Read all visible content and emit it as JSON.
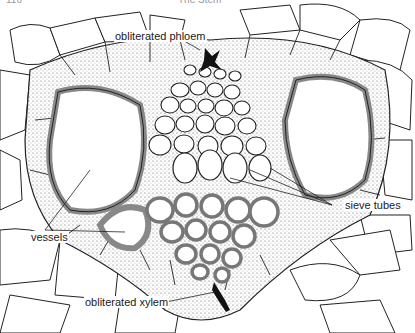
{
  "header": {
    "page_number": "116",
    "running_title": "The Stem"
  },
  "figure": {
    "labels": {
      "obliterated_phloem": "obliterated phloem",
      "vessels": "vessels",
      "sieve_tubes": "sieve tubes",
      "obliterated_xylem": "obliterated xylem"
    },
    "colors": {
      "line": "#1a1a1a",
      "stipple": "#6b6b6b",
      "wall": "#8a8a8a",
      "background": "#ffffff"
    }
  }
}
